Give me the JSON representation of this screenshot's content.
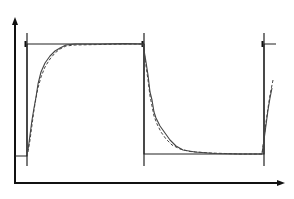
{
  "chart_data": {
    "type": "line",
    "title": "",
    "xlabel": "",
    "ylabel": "",
    "grid": false,
    "legend": null,
    "axes": {
      "origin_px": [
        15,
        183
      ],
      "y_arrow_tip_px": [
        15,
        17
      ],
      "x_arrow_tip_px": [
        285,
        183
      ],
      "color": "#111111"
    },
    "switch_markers_x_px": [
      27,
      144,
      264
    ],
    "marker_y_range_px": [
      33,
      166
    ],
    "reference_levels": {
      "high_y_px": 44,
      "low_y_px": 155
    },
    "series": [
      {
        "name": "reference square wave",
        "style": "solid",
        "color": "#222222",
        "points_px": [
          [
            15,
            156
          ],
          [
            27,
            156
          ],
          [
            27,
            44
          ],
          [
            144,
            44
          ],
          [
            144,
            154
          ],
          [
            264,
            154
          ],
          [
            264,
            44
          ],
          [
            276,
            44
          ]
        ]
      },
      {
        "name": "measured response",
        "style": "solid",
        "color": "#444444",
        "points_px": [
          [
            28,
            150
          ],
          [
            30,
            135
          ],
          [
            32,
            120
          ],
          [
            34,
            108
          ],
          [
            36,
            97
          ],
          [
            38,
            84
          ],
          [
            41,
            72
          ],
          [
            45,
            63
          ],
          [
            50,
            56
          ],
          [
            55,
            51
          ],
          [
            60,
            48
          ],
          [
            66,
            45
          ],
          [
            75,
            44
          ],
          [
            100,
            44
          ],
          [
            125,
            43.5
          ],
          [
            143,
            44
          ],
          [
            146,
            62
          ],
          [
            148,
            75
          ],
          [
            150,
            92
          ],
          [
            152,
            100
          ],
          [
            154,
            112
          ],
          [
            156,
            118
          ],
          [
            160,
            126
          ],
          [
            165,
            133
          ],
          [
            170,
            140
          ],
          [
            176,
            146
          ],
          [
            183,
            150
          ],
          [
            195,
            152
          ],
          [
            215,
            153.5
          ],
          [
            240,
            154
          ],
          [
            262,
            154
          ],
          [
            264,
            140
          ],
          [
            266,
            125
          ],
          [
            268,
            110
          ],
          [
            270,
            98
          ],
          [
            272,
            88
          ]
        ]
      },
      {
        "name": "model / simulated response",
        "style": "dashed",
        "color": "#444444",
        "points_px": [
          [
            28,
            152
          ],
          [
            30,
            140
          ],
          [
            32,
            125
          ],
          [
            34,
            110
          ],
          [
            36,
            98
          ],
          [
            38,
            88
          ],
          [
            41,
            77
          ],
          [
            45,
            67
          ],
          [
            50,
            59
          ],
          [
            55,
            53
          ],
          [
            60,
            49
          ],
          [
            66,
            46
          ],
          [
            75,
            45
          ],
          [
            100,
            44.5
          ],
          [
            125,
            44
          ],
          [
            143,
            44
          ],
          [
            146,
            66
          ],
          [
            148,
            80
          ],
          [
            150,
            96
          ],
          [
            152,
            106
          ],
          [
            154,
            116
          ],
          [
            157,
            124
          ],
          [
            161,
            132
          ],
          [
            166,
            139
          ],
          [
            172,
            145
          ],
          [
            180,
            149
          ],
          [
            190,
            151.5
          ],
          [
            210,
            153
          ],
          [
            240,
            154
          ],
          [
            262,
            154
          ],
          [
            264,
            138
          ],
          [
            266,
            122
          ],
          [
            268,
            108
          ],
          [
            270,
            95
          ],
          [
            273,
            80
          ]
        ]
      }
    ]
  }
}
